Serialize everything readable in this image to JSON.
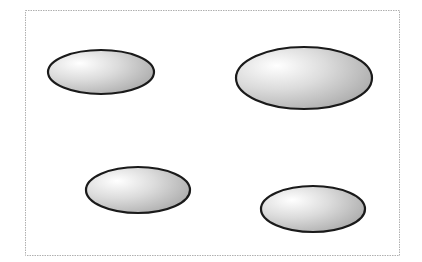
{
  "diagram": {
    "colors": {
      "frame_stroke": "#b0b0b0",
      "ellipse_stroke": "#1a1a1a",
      "gradient_highlight": "#ffffff",
      "gradient_mid": "#dcdcdc",
      "gradient_shadow": "#a8a8a8"
    },
    "shapes": [
      {
        "id": "ellipse-top-left",
        "kind": "ellipse"
      },
      {
        "id": "ellipse-top-right",
        "kind": "ellipse"
      },
      {
        "id": "ellipse-bottom-left",
        "kind": "ellipse"
      },
      {
        "id": "ellipse-bottom-right",
        "kind": "ellipse"
      }
    ]
  }
}
